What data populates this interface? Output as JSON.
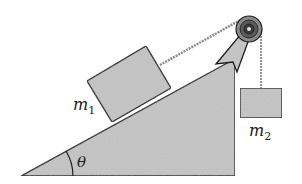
{
  "diagram": {
    "title": "",
    "type": "incline-pulley-system",
    "labels": {
      "mass1": "m",
      "mass1_sub": "1",
      "mass2": "m",
      "mass2_sub": "2",
      "angle": "θ"
    },
    "colors": {
      "fill": "#c4c4c4",
      "stroke": "#1e1e1e",
      "rope": "#8a8a8a",
      "pulley_outer": "#6a6a6a",
      "pulley_inner": "#3a3a3a",
      "background": "#ffffff"
    }
  }
}
